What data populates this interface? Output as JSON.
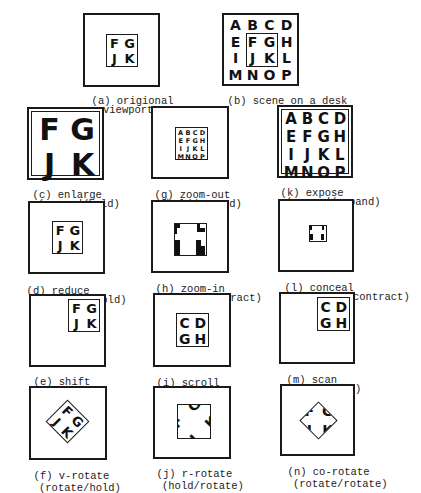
{
  "panels": {
    "a": {
      "label": "(a) origional",
      "label2": "viewport",
      "letters": [
        "F",
        "G",
        "J",
        "K"
      ]
    },
    "b": {
      "label": "(b) scene on a desk",
      "letters": [
        "A",
        "B",
        "C",
        "D",
        "E",
        "F",
        "G",
        "H",
        "I",
        "J",
        "K",
        "L",
        "M",
        "N",
        "O",
        "P"
      ]
    },
    "c": {
      "label": "(c) enlarge",
      "label2": "(expand/hold)",
      "letters": [
        "F",
        "G",
        "J",
        "K"
      ]
    },
    "g": {
      "label": "(g) zoom-out",
      "label2": "(hold/expand)",
      "letters": [
        "A",
        "B",
        "C",
        "D",
        "E",
        "F",
        "G",
        "H",
        "I",
        "J",
        "K",
        "L",
        "M",
        "N",
        "O",
        "P"
      ]
    },
    "k": {
      "label": "(k) expose",
      "label2": "(expand/expand)",
      "letters": [
        "A",
        "B",
        "C",
        "D",
        "E",
        "F",
        "G",
        "H",
        "I",
        "J",
        "K",
        "L",
        "M",
        "N",
        "O",
        "P"
      ]
    },
    "d": {
      "label": "(d) reduce",
      "label2": "(contract/hold)",
      "letters": [
        "F",
        "G",
        "J",
        "K"
      ]
    },
    "h": {
      "label": "(h) zoom-in",
      "label2": "(hold/ contract)"
    },
    "l": {
      "label": "(l) conceal",
      "label2": "(contract/contract)"
    },
    "e": {
      "label": "(e) shift",
      "label2": "(move/hold)",
      "letters": [
        "F",
        "G",
        "J",
        "K"
      ]
    },
    "i": {
      "label": "(i) scroll",
      "label2": "(hold/move)",
      "letters": [
        "C",
        "D",
        "G",
        "H"
      ]
    },
    "m": {
      "label": "(m) scan",
      "label2": "(move/move)",
      "letters": [
        "C",
        "D",
        "G",
        "H"
      ]
    },
    "f": {
      "label": "(f) v-rotate",
      "label2": "(rotate/hold)",
      "letters": [
        "F",
        "G",
        "J",
        "K"
      ]
    },
    "j": {
      "label": "(j) r-rotate",
      "label2": "(hold/rotate)",
      "letters": [
        "F",
        "G",
        "J",
        "K"
      ]
    },
    "n": {
      "label": "(n) co-rotate",
      "label2": "(rotate/rotate)",
      "letters": [
        "F",
        "G",
        "J",
        "K"
      ]
    }
  }
}
